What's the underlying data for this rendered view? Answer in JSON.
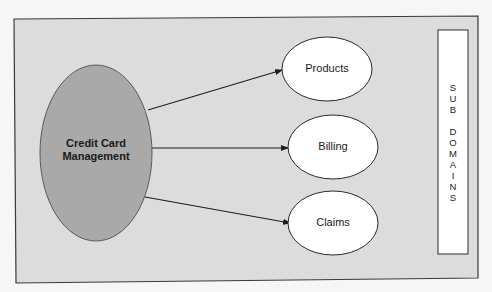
{
  "diagram": {
    "core": {
      "label": "Credit Card\nManagement",
      "line1": "Credit Card",
      "line2": "Management"
    },
    "subdomains": [
      {
        "label": "Products"
      },
      {
        "label": "Billing"
      },
      {
        "label": "Claims"
      }
    ],
    "side_panel": {
      "label": "SUB DOMAINS",
      "vertical_text": "S\nU\nB\n\nD\nO\nM\nA\nI\nN\nS"
    },
    "colors": {
      "frame_fill": "#dcdcdc",
      "frame_stroke": "#3a3a3a",
      "core_fill": "#a9a9a9",
      "subdomain_fill": "#ffffff",
      "arrow": "#1e1e1e"
    }
  }
}
